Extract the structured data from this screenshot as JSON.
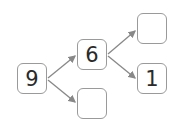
{
  "diagram": {
    "type": "number-bond-tree",
    "nodes": [
      {
        "id": "root",
        "value": "9",
        "x": 17,
        "y": 63
      },
      {
        "id": "mid-top",
        "value": "6",
        "x": 77,
        "y": 39
      },
      {
        "id": "mid-bottom",
        "value": "",
        "x": 77,
        "y": 88
      },
      {
        "id": "right-top",
        "value": "",
        "x": 137,
        "y": 13
      },
      {
        "id": "right-bottom",
        "value": "1",
        "x": 137,
        "y": 63
      }
    ],
    "edges": [
      {
        "from": "root",
        "to": "mid-top"
      },
      {
        "from": "root",
        "to": "mid-bottom"
      },
      {
        "from": "mid-top",
        "to": "right-top"
      },
      {
        "from": "mid-top",
        "to": "right-bottom"
      }
    ],
    "colors": {
      "border": "#9a9a9a",
      "arrow": "#888888",
      "text": "#2a2a2a"
    }
  }
}
